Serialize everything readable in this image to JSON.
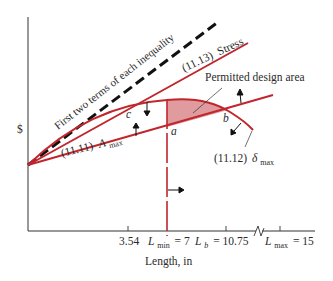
{
  "figure": {
    "y_axis_label": "$",
    "x_axis_label": "Length, in",
    "curves": {
      "dashed": "First two terms of each inequality",
      "stress": {
        "eq": "(11.13)",
        "name": "Stress"
      },
      "area": {
        "eq": "(11.11)",
        "symbol": "A",
        "sub": "max"
      },
      "deflection": {
        "eq": "(11.12)",
        "symbol": "δ",
        "sub": "max"
      }
    },
    "region_label": "Permitted design area",
    "points": {
      "a": "a",
      "b": "b",
      "c": "c"
    },
    "ticks": {
      "t1": "3.54",
      "lmin": {
        "symbol": "L",
        "sub": "min",
        "value": "= 7"
      },
      "lb": {
        "symbol": "L",
        "sub": "b",
        "value": "= 10.75"
      },
      "lmax": {
        "symbol": "L",
        "sub": "max",
        "value": "= 15"
      }
    },
    "colors": {
      "constraint": "#c0262c",
      "region_fill": "#d98a8c",
      "dashed": "#111111",
      "axis": "#333333"
    }
  }
}
